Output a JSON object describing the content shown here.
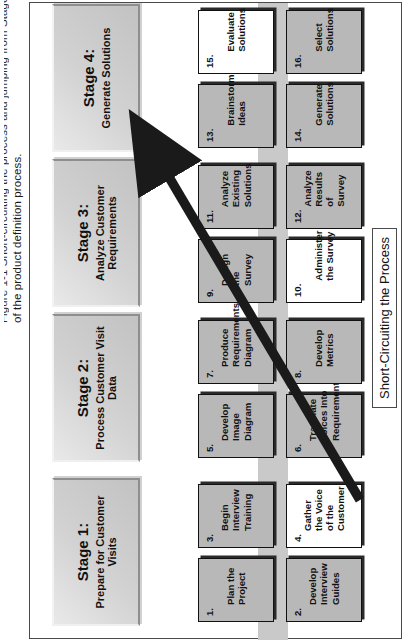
{
  "figure": {
    "caption_line1": "Figure 1-1  Short-circuiting the process and jumping from Stage 1 to Stage 4",
    "caption_line2": "of the product definition process."
  },
  "legend": {
    "label": "Short-Circuiting the Process"
  },
  "colors": {
    "band": "#c9c9c9",
    "step_fill": "#b8b8b8",
    "step_fill_highlight": "#ffffff",
    "stage_fill": "#d2d2d2",
    "outline": "#111111",
    "arrow": "#1a1a1a",
    "frame": "#4a4a4a"
  },
  "stages": [
    {
      "id": "stage-1",
      "title": "Stage 1:",
      "subtitle": "Prepare for Customer Visits",
      "steps": [
        {
          "num": "1.",
          "text": "Plan the Project",
          "highlight": false
        },
        {
          "num": "2.",
          "text": "Develop Interview Guides",
          "highlight": false
        },
        {
          "num": "3.",
          "text": "Begin Interview Training",
          "highlight": false
        },
        {
          "num": "4.",
          "text": "Gather the Voice of the Customer",
          "highlight": true
        }
      ]
    },
    {
      "id": "stage-2",
      "title": "Stage 2:",
      "subtitle": "Process Customer Visit Data",
      "steps": [
        {
          "num": "5.",
          "text": "Develop Image Diagram",
          "highlight": false
        },
        {
          "num": "6.",
          "text": "Translate Voices Into Requirements",
          "highlight": false
        },
        {
          "num": "7.",
          "text": "Produce Requirements Diagram",
          "highlight": false
        },
        {
          "num": "8.",
          "text": "Develop Metrics",
          "highlight": false
        }
      ]
    },
    {
      "id": "stage-3",
      "title": "Stage 3:",
      "subtitle": "Analyze Customer Requirements",
      "steps": [
        {
          "num": "9.",
          "text": "Design the Survey",
          "highlight": false
        },
        {
          "num": "10.",
          "text": "Administer the Survey",
          "highlight": true
        },
        {
          "num": "11.",
          "text": "Analyze Existing Solutions",
          "highlight": false
        },
        {
          "num": "12.",
          "text": "Analyze Results of Survey",
          "highlight": false
        }
      ]
    },
    {
      "id": "stage-4",
      "title": "Stage 4:",
      "subtitle": "Generate Solutions",
      "steps": [
        {
          "num": "13.",
          "text": "Brainstorm Ideas",
          "highlight": false
        },
        {
          "num": "14.",
          "text": "Generate Solutions",
          "highlight": false
        },
        {
          "num": "15.",
          "text": "Evaluate Solutions",
          "highlight": true
        },
        {
          "num": "16.",
          "text": "Select Solutions",
          "highlight": false
        }
      ]
    }
  ]
}
